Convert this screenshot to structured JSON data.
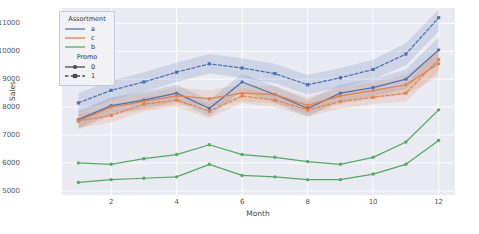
{
  "chart_data": {
    "type": "line",
    "title": "",
    "xlabel": "Month",
    "ylabel": "Sales",
    "x": [
      1,
      2,
      3,
      4,
      5,
      6,
      7,
      8,
      9,
      10,
      11,
      12
    ],
    "xlim": [
      0.5,
      12.5
    ],
    "ylim": [
      4850,
      11550
    ],
    "xticks": [
      2,
      4,
      6,
      8,
      10,
      12
    ],
    "yticks": [
      5000,
      6000,
      7000,
      8000,
      9000,
      10000,
      11000
    ],
    "grid": true,
    "legend_position": "upper left",
    "confidence_band": true,
    "series": [
      {
        "name": "a, Promo 0",
        "assortment": "a",
        "promo": "0",
        "color": "#4c72b0",
        "dash": "solid",
        "marker": "circle",
        "values": [
          7550,
          8050,
          8250,
          8500,
          7950,
          8900,
          8450,
          7950,
          8500,
          8700,
          9000,
          10050
        ],
        "band_low": [
          7250,
          7750,
          7950,
          8200,
          7650,
          8600,
          8150,
          7650,
          8200,
          8400,
          8650,
          9600
        ],
        "band_high": [
          7850,
          8350,
          8550,
          8800,
          8250,
          9200,
          8750,
          8250,
          8800,
          9000,
          9350,
          10500
        ]
      },
      {
        "name": "a, Promo 1",
        "assortment": "a",
        "promo": "1",
        "color": "#4c72b0",
        "dash": "dashed",
        "marker": "square",
        "values": [
          8150,
          8600,
          8900,
          9250,
          9550,
          9400,
          9200,
          8800,
          9050,
          9350,
          9900,
          11200
        ],
        "band_low": [
          7800,
          8250,
          8550,
          8900,
          9200,
          9050,
          8850,
          8450,
          8700,
          9000,
          9500,
          10700
        ],
        "band_high": [
          8500,
          8950,
          9250,
          9600,
          9900,
          9750,
          9550,
          9150,
          9400,
          9700,
          10300,
          11500
        ]
      },
      {
        "name": "c, Promo 0",
        "assortment": "c",
        "promo": "0",
        "color": "#dd8452",
        "dash": "solid",
        "marker": "circle",
        "values": [
          7500,
          8000,
          8200,
          8400,
          8300,
          8500,
          8450,
          8050,
          8400,
          8600,
          8800,
          9550
        ],
        "band_low": [
          7200,
          7700,
          7900,
          8100,
          8000,
          8200,
          8150,
          7750,
          8100,
          8300,
          8450,
          9100
        ],
        "band_high": [
          7800,
          8300,
          8500,
          8700,
          8600,
          8800,
          8750,
          8350,
          8700,
          8900,
          9150,
          10000
        ]
      },
      {
        "name": "c, Promo 1",
        "assortment": "c",
        "promo": "1",
        "color": "#dd8452",
        "dash": "dashed",
        "marker": "square",
        "values": [
          7500,
          7700,
          8100,
          8250,
          7850,
          8400,
          8250,
          7900,
          8200,
          8350,
          8500,
          9700
        ],
        "band_low": [
          7250,
          7450,
          7850,
          8000,
          7600,
          8150,
          8000,
          7650,
          7950,
          8100,
          8200,
          9300
        ],
        "band_high": [
          7750,
          7950,
          8350,
          8500,
          8100,
          8650,
          8500,
          8150,
          8450,
          8600,
          8800,
          10100
        ]
      },
      {
        "name": "b, Promo 0",
        "assortment": "b",
        "promo": "0",
        "color": "#55a868",
        "dash": "solid",
        "marker": "circle",
        "values": [
          6000,
          5950,
          6150,
          6300,
          6650,
          6300,
          6200,
          6050,
          5950,
          6200,
          6750,
          7900
        ],
        "band_low": [
          6000,
          5950,
          6150,
          6300,
          6650,
          6300,
          6200,
          6050,
          5950,
          6200,
          6750,
          7900
        ],
        "band_high": [
          6000,
          5950,
          6150,
          6300,
          6650,
          6300,
          6200,
          6050,
          5950,
          6200,
          6750,
          7900
        ]
      },
      {
        "name": "b, Promo 1",
        "assortment": "b",
        "promo": "1",
        "color": "#55a868",
        "dash": "solid",
        "marker": "circle",
        "values": [
          5300,
          5400,
          5450,
          5500,
          5950,
          5550,
          5500,
          5400,
          5400,
          5600,
          5950,
          6800
        ],
        "band_low": [
          5300,
          5400,
          5450,
          5500,
          5950,
          5550,
          5500,
          5400,
          5400,
          5600,
          5950,
          6800
        ],
        "band_high": [
          5300,
          5400,
          5450,
          5500,
          5950,
          5550,
          5500,
          5400,
          5400,
          5600,
          5950,
          6800
        ]
      }
    ]
  },
  "legend": {
    "assortment": {
      "title": "Assortment",
      "items": [
        {
          "label": "a",
          "color": "#4c72b0"
        },
        {
          "label": "c",
          "color": "#dd8452"
        },
        {
          "label": "b",
          "color": "#55a868"
        }
      ]
    },
    "promo": {
      "title": "Promo",
      "items": [
        {
          "label": "0",
          "dash": "solid",
          "marker": "circle"
        },
        {
          "label": "1",
          "dash": "dashed",
          "marker": "square"
        }
      ]
    }
  },
  "axes": {
    "ylabel": "Sales",
    "xlabel": "Month",
    "ytick_labels": [
      "5000",
      "6000",
      "7000",
      "8000",
      "9000",
      "10000",
      "11000"
    ],
    "xtick_labels": [
      "2",
      "4",
      "6",
      "8",
      "10",
      "12"
    ]
  },
  "colors": {
    "plot_background": "#eaeaf2",
    "figure_background": "#ffffff",
    "grid": "#ffffff",
    "tick_text": "#555555"
  }
}
